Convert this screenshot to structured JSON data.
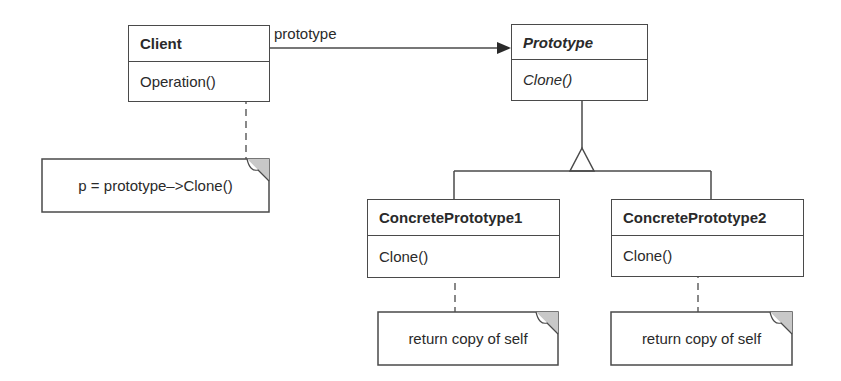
{
  "diagram": {
    "type": "UML class diagram (Prototype pattern)",
    "classes": {
      "client": {
        "name": "Client",
        "operation": "Operation()"
      },
      "prototype": {
        "name": "Prototype",
        "operation": "Clone()",
        "abstract": true
      },
      "concrete1": {
        "name": "ConcretePrototype1",
        "operation": "Clone()"
      },
      "concrete2": {
        "name": "ConcretePrototype2",
        "operation": "Clone()"
      }
    },
    "association_label": "prototype",
    "notes": {
      "client": "p = prototype–>Clone()",
      "concrete1": "return copy of self",
      "concrete2": "return copy of self"
    },
    "colors": {
      "line": "#4a4a4a",
      "fold": "#c8c8c8"
    }
  }
}
